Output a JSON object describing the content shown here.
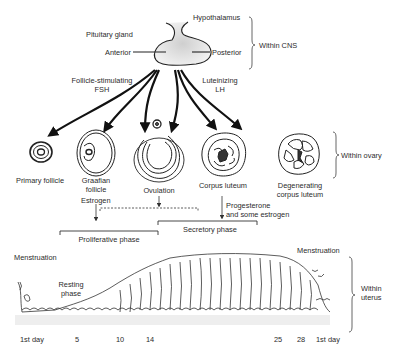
{
  "cns": {
    "hypothalamus": "Hypothalamus",
    "pituitary_gland": "Pituitary gland",
    "anterior": "Anterior",
    "posterior": "Posterior",
    "bracket_label": "Within CNS"
  },
  "hormones": {
    "fsh_line1": "Follicle-stimulating",
    "fsh_line2": "FSH",
    "lh_line1": "Luteinizing",
    "lh_line2": "LH"
  },
  "ovary": {
    "stages": [
      {
        "line1": "Primary follicle",
        "line2": ""
      },
      {
        "line1": "Graafian",
        "line2": "follicle"
      },
      {
        "line1": "Ovulation",
        "line2": ""
      },
      {
        "line1": "Corpus luteum",
        "line2": ""
      },
      {
        "line1": "Degenerating",
        "line2": "corpus luteum"
      }
    ],
    "bracket_label": "Within ovary"
  },
  "secretions": {
    "estrogen": "Estrogen",
    "progesterone_line1": "Progesterone",
    "progesterone_line2": "and some estrogen"
  },
  "phases": {
    "proliferative": "Proliferative phase",
    "secretory": "Secretory phase"
  },
  "uterus": {
    "menstruation_start": "Menstruation",
    "resting_line1": "Resting",
    "resting_line2": "phase",
    "menstruation_end": "Menstruation",
    "bracket_line1": "Within",
    "bracket_line2": "uterus"
  },
  "timeline": {
    "days": [
      {
        "label": "1st day",
        "x": 20
      },
      {
        "label": "5",
        "x": 75
      },
      {
        "label": "10",
        "x": 118
      },
      {
        "label": "14",
        "x": 148
      },
      {
        "label": "25",
        "x": 276
      },
      {
        "label": "28",
        "x": 299
      },
      {
        "label": "1st day",
        "x": 322
      }
    ]
  }
}
